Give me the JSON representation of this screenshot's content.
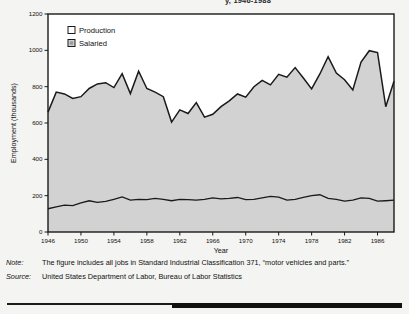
{
  "figure": {
    "clipped_header": "y, 1946-1988"
  },
  "chart_data": {
    "type": "area",
    "title": "",
    "xlabel": "Year",
    "ylabel": "Employment (thousands)",
    "xlim": [
      1946,
      1988
    ],
    "ylim": [
      0,
      1200
    ],
    "ytick_values": [
      0,
      200,
      400,
      600,
      800,
      1000,
      1200
    ],
    "ytick_labels": [
      "0",
      "200",
      "400",
      "600",
      "800",
      "1000",
      "1200"
    ],
    "xtick_values": [
      1946,
      1950,
      1954,
      1958,
      1962,
      1966,
      1970,
      1974,
      1978,
      1982,
      1986
    ],
    "xtick_labels": [
      "1946",
      "1950",
      "1954",
      "1958",
      "1962",
      "1966",
      "1970",
      "1974",
      "1978",
      "1982",
      "1986"
    ],
    "grid": false,
    "stacked": true,
    "legend_position": "top-left",
    "legend": [
      {
        "label": "Production",
        "color": "#ffffff"
      },
      {
        "label": "Salaried",
        "color": "#d2d2d2"
      }
    ],
    "x": [
      1946,
      1947,
      1948,
      1949,
      1950,
      1951,
      1952,
      1953,
      1954,
      1955,
      1956,
      1957,
      1958,
      1959,
      1960,
      1961,
      1962,
      1963,
      1964,
      1965,
      1966,
      1967,
      1968,
      1969,
      1970,
      1971,
      1972,
      1973,
      1974,
      1975,
      1976,
      1977,
      1978,
      1979,
      1980,
      1981,
      1982,
      1983,
      1984,
      1985,
      1986,
      1987,
      1988
    ],
    "series": [
      {
        "name": "Salaried",
        "values": [
          128,
          138,
          148,
          145,
          160,
          172,
          163,
          168,
          180,
          193,
          175,
          180,
          178,
          185,
          180,
          172,
          180,
          178,
          175,
          180,
          188,
          182,
          185,
          190,
          178,
          180,
          188,
          196,
          192,
          175,
          180,
          190,
          200,
          205,
          185,
          180,
          170,
          175,
          188,
          185,
          170,
          172,
          175
        ]
      },
      {
        "name": "Total (Production + Salaried)",
        "note": "upper boundary of stacked area, read directly off the y-axis",
        "values": [
          660,
          770,
          760,
          735,
          745,
          790,
          815,
          822,
          795,
          872,
          762,
          885,
          790,
          770,
          745,
          605,
          672,
          652,
          712,
          632,
          648,
          690,
          722,
          760,
          742,
          800,
          835,
          810,
          868,
          852,
          905,
          848,
          788,
          870,
          965,
          875,
          838,
          782,
          935,
          998,
          988,
          690,
          830
        ]
      }
    ]
  },
  "notes": {
    "note_key": "Note:",
    "note_body": "The figure includes all jobs in Standard Industrial Classification 371, “motor vehicles and parts.”",
    "source_key": "Source:",
    "source_body": "United States Department of Labor, Bureau of Labor Statistics"
  },
  "colors": {
    "salaried_fill": "#d2d2d2",
    "production_fill": "#ffffff",
    "line": "#1a1a1a",
    "page_background": "#f4f4f2"
  }
}
